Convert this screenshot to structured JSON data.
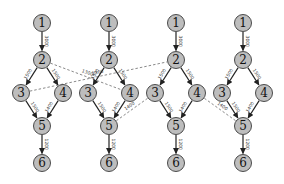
{
  "diagram": {
    "title": "",
    "columns": [
      {
        "x": 42,
        "id": "graph-1"
      },
      {
        "x": 109,
        "id": "graph-2"
      },
      {
        "x": 176,
        "id": "graph-3"
      },
      {
        "x": 243,
        "id": "graph-4"
      }
    ],
    "node_layout": {
      "1": {
        "dx": 0,
        "y": 23
      },
      "2": {
        "dx": 0,
        "y": 60
      },
      "3": {
        "dx": -21,
        "y": 93
      },
      "4": {
        "dx": 21,
        "y": 93
      },
      "5": {
        "dx": 0,
        "y": 126
      },
      "6": {
        "dx": 0,
        "y": 163
      }
    },
    "nodes": [
      "1",
      "2",
      "3",
      "4",
      "5",
      "6"
    ],
    "edges": [
      {
        "from": "1",
        "to": "2",
        "label": "3000"
      },
      {
        "from": "2",
        "to": "3",
        "label": "1500"
      },
      {
        "from": "2",
        "to": "4",
        "label": "1500"
      },
      {
        "from": "3",
        "to": "5",
        "label": "1500"
      },
      {
        "from": "4",
        "to": "5",
        "label": "1400"
      },
      {
        "from": "5",
        "to": "6",
        "label": "1200"
      }
    ],
    "cross_edges": [
      {
        "from_col": 0,
        "from": "2",
        "to_col": 1,
        "to": "4",
        "label": "1300"
      },
      {
        "from_col": 0,
        "from": "3",
        "to_col": 2,
        "to": "2",
        "label": "1300"
      },
      {
        "from_col": 1,
        "from": "5",
        "to_col": 2,
        "to": "3",
        "label": "1400"
      },
      {
        "from_col": 2,
        "from": "4",
        "to_col": 3,
        "to": "5",
        "label": "1400"
      }
    ],
    "colors": {
      "node_fill": "#bdbdbd",
      "node_stroke": "#4a4a4a",
      "edge": "#222222",
      "dashed_edge": "#8a8a8a"
    }
  }
}
